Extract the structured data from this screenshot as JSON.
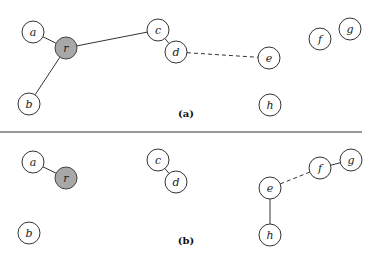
{
  "diagram": {
    "colors": {
      "root_fill": "#a8a8a8",
      "node_fill": "#ffffff",
      "stroke": "#333333"
    },
    "panels": [
      {
        "label": "(a)",
        "label_pos": [
          186,
          113
        ],
        "nodes": [
          {
            "id": "a",
            "label": "a",
            "x": 33,
            "y": 32,
            "root": false
          },
          {
            "id": "r",
            "label": "r",
            "x": 66,
            "y": 48,
            "root": true
          },
          {
            "id": "b",
            "label": "b",
            "x": 29,
            "y": 104,
            "root": false
          },
          {
            "id": "c",
            "label": "c",
            "x": 158,
            "y": 30,
            "root": false
          },
          {
            "id": "d",
            "label": "d",
            "x": 176,
            "y": 52,
            "root": false
          },
          {
            "id": "e",
            "label": "e",
            "x": 269,
            "y": 58,
            "root": false
          },
          {
            "id": "f",
            "label": "f",
            "x": 320,
            "y": 39,
            "root": false
          },
          {
            "id": "g",
            "label": "g",
            "x": 350,
            "y": 29,
            "root": false
          },
          {
            "id": "h",
            "label": "h",
            "x": 270,
            "y": 105,
            "root": false
          }
        ],
        "edges": [
          {
            "from": "a",
            "to": "r",
            "style": "solid"
          },
          {
            "from": "r",
            "to": "b",
            "style": "solid"
          },
          {
            "from": "r",
            "to": "c",
            "style": "solid"
          },
          {
            "from": "c",
            "to": "d",
            "style": "solid"
          },
          {
            "from": "d",
            "to": "e",
            "style": "dashed"
          }
        ]
      },
      {
        "label": "(b)",
        "label_pos": [
          186,
          240
        ],
        "nodes": [
          {
            "id": "a",
            "label": "a",
            "x": 33,
            "y": 162,
            "root": false
          },
          {
            "id": "r",
            "label": "r",
            "x": 66,
            "y": 178,
            "root": true
          },
          {
            "id": "b",
            "label": "b",
            "x": 29,
            "y": 233,
            "root": false
          },
          {
            "id": "c",
            "label": "c",
            "x": 158,
            "y": 160,
            "root": false
          },
          {
            "id": "d",
            "label": "d",
            "x": 176,
            "y": 182,
            "root": false
          },
          {
            "id": "e",
            "label": "e",
            "x": 270,
            "y": 188,
            "root": false
          },
          {
            "id": "f",
            "label": "f",
            "x": 320,
            "y": 168,
            "root": false
          },
          {
            "id": "g",
            "label": "g",
            "x": 351,
            "y": 160,
            "root": false
          },
          {
            "id": "h",
            "label": "h",
            "x": 270,
            "y": 235,
            "root": false
          }
        ],
        "edges": [
          {
            "from": "a",
            "to": "r",
            "style": "solid"
          },
          {
            "from": "c",
            "to": "d",
            "style": "solid"
          },
          {
            "from": "e",
            "to": "f",
            "style": "dashed"
          },
          {
            "from": "f",
            "to": "g",
            "style": "solid"
          },
          {
            "from": "e",
            "to": "h",
            "style": "solid"
          }
        ]
      }
    ],
    "divider": {
      "x1": 0,
      "x2": 362,
      "y": 132
    }
  }
}
